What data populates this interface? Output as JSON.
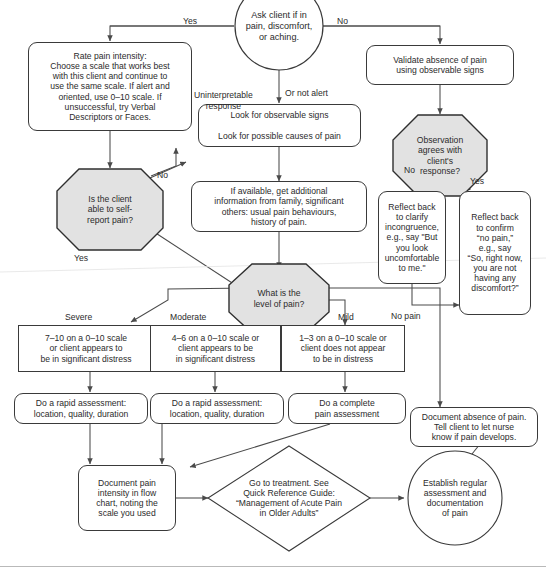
{
  "diagram": {
    "colors": {
      "decision_fill": "#e2e2e2",
      "decision_stroke": "#2f2f2f",
      "box_stroke": "#3a3a3a",
      "text": "#2b2b2b",
      "arrow": "#4a4a4a",
      "background": "#ffffff"
    }
  },
  "nodes": {
    "start": {
      "shape": "circle",
      "text": "Ask client if in\npain, discomfort,\nor aching."
    },
    "rate_pain_intensity": {
      "shape": "rounded-rect",
      "text": "Rate pain intensity:\nChoose a scale that works best\nwith this client and continue to\nuse the same scale. If alert and\noriented, use 0–10 scale. If\nunsuccessful, try Verbal\nDescriptors or Faces."
    },
    "validate_absence": {
      "shape": "rounded-rect",
      "text": "Validate absence of pain\nusing observable signs"
    },
    "look_for_signs": {
      "shape": "rounded-rect",
      "text": "Look for observable signs\n\nLook for possible causes of pain"
    },
    "additional_information": {
      "shape": "rounded-rect",
      "text": "If available, get additional\ninformation from family, significant\nothers: usual pain behaviours,\nhistory of pain."
    },
    "self_report_decision": {
      "shape": "octagon",
      "text": "Is the client\nable to self-\nreport pain?"
    },
    "observation_agrees_decision": {
      "shape": "octagon",
      "text": "Observation\nagrees with\nclient's\nresponse?"
    },
    "level_of_pain_decision": {
      "shape": "octagon",
      "text": "What is the\nlevel of pain?"
    },
    "reflect_clarify": {
      "shape": "rounded-rect",
      "text": "Reflect back\nto clarify\nincongruence,\ne.g., say \"But\nyou look\nuncomfortable\nto me.\""
    },
    "reflect_confirm": {
      "shape": "rounded-rect",
      "text": "Reflect back\nto confirm\n“no pain,”\ne.g., say\n“So, right now,\nyou are not\nhaving any\ndiscomfort?”"
    },
    "severe_criteria": {
      "shape": "rect",
      "text": "7–10 on a 0–10 scale\nor client appears to\nbe in significant distress"
    },
    "moderate_criteria": {
      "shape": "rect",
      "text": "4–6 on a 0–10 scale or\nclient appears to be\nin significant distress"
    },
    "mild_criteria": {
      "shape": "rect",
      "text": "1–3 on a 0–10 scale or\nclient does not appear\nto be in distress"
    },
    "rapid_assessment_severe": {
      "shape": "rounded-rect",
      "text": "Do a rapid assessment:\nlocation, quality, duration"
    },
    "rapid_assessment_moderate": {
      "shape": "rounded-rect",
      "text": "Do a rapid assessment:\nlocation, quality, duration"
    },
    "complete_assessment": {
      "shape": "rounded-rect",
      "text": "Do a complete\npain assessment"
    },
    "document_absence": {
      "shape": "rounded-rect",
      "text": "Document absence of pain.\nTell client to let nurse\nknow if pain develops."
    },
    "document_pain_intensity": {
      "shape": "rounded-rect",
      "text": "Document pain\nintensity in flow\nchart, noting the\nscale you used"
    },
    "go_to_treatment": {
      "shape": "diamond",
      "text": "Go to treatment. See\nQuick Reference Guide:\n“Management of Acute Pain\nin Older Adults”"
    },
    "establish_regular": {
      "shape": "circle",
      "text": "Establish regular\nassessment and\ndocumentation\nof pain"
    }
  },
  "edge_labels": {
    "yes_top_left": "Yes",
    "no_top_right": "No",
    "uninterpretable": "Uninterpretable\nresponse",
    "or_not_alert": "Or not alert",
    "no_self_report": "No",
    "yes_self_report": "Yes",
    "no_observation": "No",
    "yes_observation": "Yes",
    "severe": "Severe",
    "moderate": "Moderate",
    "mild": "Mild",
    "no_pain": "No pain"
  }
}
